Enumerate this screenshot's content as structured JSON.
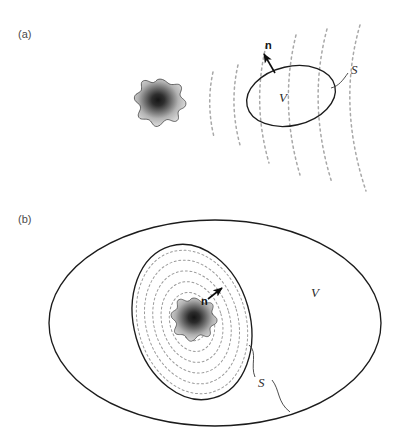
{
  "figure": {
    "background_color": "#ffffff",
    "width": 417,
    "height": 434
  },
  "colors": {
    "solid_curve": "#1c1c1c",
    "dashed_wave": "#a8a8a8",
    "dashed_contour": "#9a9a9a",
    "leader": "#3a3a3a",
    "label_text": "#2b2b2b",
    "panel_tag": "#4a4a4a",
    "blob_edge": "#2a2a2a",
    "blob_core": "#1a1a1a",
    "blob_rim": "#cfcfcf"
  },
  "panels": [
    {
      "id": "a",
      "tag": "(a)",
      "description": "Source radiating outward; surface S bounds an external volume V not containing the source",
      "labels": {
        "volume": "V",
        "surface": "S",
        "normal": "n"
      },
      "normal_direction": "outward-up-left",
      "wave_arc_count": 6,
      "source": {
        "name": "radiating-source-blob",
        "shading": "dark-center radial gradient"
      }
    },
    {
      "id": "b",
      "tag": "(b)",
      "description": "Source enclosed by inner surface S inside a large volume V; normal n points inward toward the source region",
      "labels": {
        "volume": "V",
        "surface": "S",
        "normal": "n"
      },
      "normal_direction": "inward-up-right",
      "contour_ring_count": 6,
      "source": {
        "name": "radiating-source-blob",
        "shading": "dark-center radial gradient"
      }
    }
  ]
}
